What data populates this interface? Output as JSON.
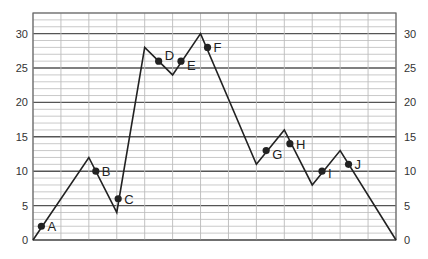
{
  "chart_data": {
    "type": "line",
    "title": "",
    "xlabel": "",
    "ylabel": "",
    "ylim": [
      0,
      33
    ],
    "xlim": [
      0,
      13
    ],
    "grid": true,
    "y_ticks": [
      0,
      5,
      10,
      15,
      20,
      25,
      30
    ],
    "y_tick_labels": [
      "0",
      "5",
      "10",
      "15",
      "20",
      "25",
      "30"
    ],
    "y_axis_sides": "both",
    "line": {
      "x": [
        0,
        2,
        3,
        4,
        5,
        6,
        8,
        9,
        10,
        11,
        13
      ],
      "y": [
        0,
        12,
        4,
        28,
        24,
        30,
        11,
        16,
        8,
        13,
        0
      ]
    },
    "points": [
      {
        "label": "A",
        "x": 0.3,
        "y": 2
      },
      {
        "label": "B",
        "x": 2.25,
        "y": 10
      },
      {
        "label": "C",
        "x": 3.05,
        "y": 6
      },
      {
        "label": "D",
        "x": 4.5,
        "y": 26
      },
      {
        "label": "E",
        "x": 5.3,
        "y": 26
      },
      {
        "label": "F",
        "x": 6.25,
        "y": 28
      },
      {
        "label": "G",
        "x": 8.35,
        "y": 13
      },
      {
        "label": "H",
        "x": 9.2,
        "y": 14
      },
      {
        "label": "I",
        "x": 10.35,
        "y": 10
      },
      {
        "label": "J",
        "x": 11.3,
        "y": 11
      }
    ],
    "colors": {
      "line": "#222222",
      "major_grid": "#555555",
      "minor_grid": "#bbbbbb",
      "frame": "#666666"
    }
  }
}
